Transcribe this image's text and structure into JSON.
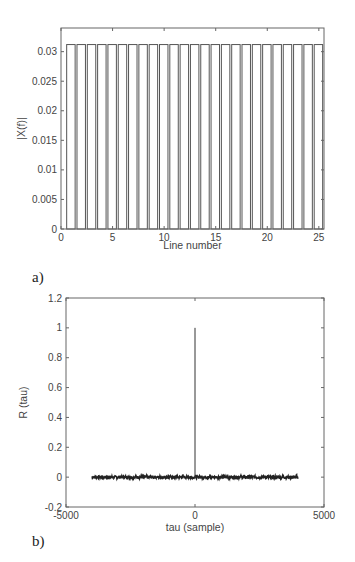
{
  "chart_data": [
    {
      "panel_label": "a)",
      "type": "bar",
      "title": "",
      "xlabel": "Line number",
      "ylabel": "|X(f)|",
      "xlim": [
        0,
        25.5
      ],
      "ylim": [
        0,
        0.034
      ],
      "xticks": [
        "0",
        "5",
        "10",
        "15",
        "20",
        "25"
      ],
      "yticks": [
        "0",
        "0.005",
        "0.01",
        "0.015",
        "0.02",
        "0.025",
        "0.03"
      ],
      "grid": false,
      "categories": [
        1,
        2,
        3,
        4,
        5,
        6,
        7,
        8,
        9,
        10,
        11,
        12,
        13,
        14,
        15,
        16,
        17,
        18,
        19,
        20,
        21,
        22,
        23,
        24,
        25
      ],
      "values": [
        0.0312,
        0.0312,
        0.0312,
        0.0312,
        0.0312,
        0.0312,
        0.0312,
        0.0312,
        0.0312,
        0.0312,
        0.0312,
        0.0312,
        0.0312,
        0.0312,
        0.0312,
        0.0312,
        0.0312,
        0.0312,
        0.0312,
        0.0312,
        0.0312,
        0.0312,
        0.0312,
        0.0312,
        0.0312
      ]
    },
    {
      "panel_label": "b)",
      "type": "line",
      "title": "",
      "xlabel": "tau (sample)",
      "ylabel": "R (tau)",
      "xlim": [
        -5000,
        5000
      ],
      "ylim": [
        -0.2,
        1.2
      ],
      "xticks": [
        "-5000",
        "0",
        "5000"
      ],
      "yticks": [
        "-0.2",
        "0",
        "0.2",
        "0.4",
        "0.6",
        "0.8",
        "1",
        "1.2"
      ],
      "grid": false,
      "series": [
        {
          "name": "autocorrelation",
          "x": [
            -4000,
            -3000,
            -2000,
            -1000,
            -1,
            0,
            1,
            1000,
            2000,
            3000,
            4000
          ],
          "values": [
            0.0,
            0.0,
            0.0,
            0.0,
            0.0,
            1.0,
            0.0,
            0.0,
            0.0,
            0.0,
            0.0
          ],
          "noise_amplitude": 0.01
        }
      ]
    }
  ]
}
